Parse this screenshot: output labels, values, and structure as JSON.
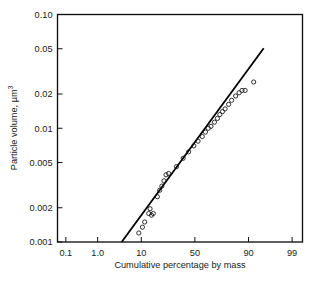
{
  "chart_data": {
    "type": "scatter",
    "title": "",
    "xlabel": "Cumulative percentage by mass",
    "ylabel": "Particle volume, µm",
    "ylabel_superscript": "3",
    "x_scale": "probability",
    "y_scale": "log",
    "xlim": [
      0.05,
      99.5
    ],
    "ylim": [
      0.001,
      0.1
    ],
    "grid": false,
    "legend": null,
    "x_ticks": [
      {
        "value": 0.1,
        "label": "0.1"
      },
      {
        "value": 1.0,
        "label": "1.0"
      },
      {
        "value": 10,
        "label": "10"
      },
      {
        "value": 50,
        "label": "50"
      },
      {
        "value": 90,
        "label": "90"
      },
      {
        "value": 99,
        "label": "99"
      }
    ],
    "y_ticks": [
      {
        "value": 0.001,
        "label": "0.001"
      },
      {
        "value": 0.002,
        "label": "0.002"
      },
      {
        "value": 0.005,
        "label": "0.005"
      },
      {
        "value": 0.01,
        "label": "0.01"
      },
      {
        "value": 0.02,
        "label": "0.02"
      },
      {
        "value": 0.05,
        "label": "0.05"
      },
      {
        "value": 0.1,
        "label": "0.10"
      }
    ],
    "series": [
      {
        "name": "Measured particle volume",
        "marker": "open-circle",
        "points": [
          [
            9.0,
            0.0012
          ],
          [
            10.5,
            0.00135
          ],
          [
            11.5,
            0.0015
          ],
          [
            13.5,
            0.00178
          ],
          [
            14.2,
            0.00196
          ],
          [
            15.0,
            0.00172
          ],
          [
            16.0,
            0.00178
          ],
          [
            18.5,
            0.0025
          ],
          [
            20.0,
            0.00285
          ],
          [
            21.5,
            0.0031
          ],
          [
            23.0,
            0.00345
          ],
          [
            24.5,
            0.0039
          ],
          [
            26.5,
            0.004
          ],
          [
            33.0,
            0.0046
          ],
          [
            39.0,
            0.00545
          ],
          [
            44.0,
            0.0062
          ],
          [
            49.0,
            0.007
          ],
          [
            53.0,
            0.0077
          ],
          [
            57.0,
            0.00845
          ],
          [
            60.0,
            0.00925
          ],
          [
            62.5,
            0.01
          ],
          [
            65.0,
            0.0104
          ],
          [
            68.0,
            0.0113
          ],
          [
            70.5,
            0.0122
          ],
          [
            72.5,
            0.0132
          ],
          [
            74.5,
            0.014
          ],
          [
            76.5,
            0.0148
          ],
          [
            79.0,
            0.0162
          ],
          [
            81.0,
            0.0176
          ],
          [
            83.5,
            0.0192
          ],
          [
            85.5,
            0.0205
          ],
          [
            87.0,
            0.0215
          ],
          [
            88.5,
            0.0215
          ],
          [
            92.0,
            0.0255
          ]
        ]
      }
    ],
    "fit_line": {
      "name": "Log-normal fit",
      "start": [
        4.0,
        0.001
      ],
      "end": [
        95.0,
        0.0505
      ]
    }
  }
}
